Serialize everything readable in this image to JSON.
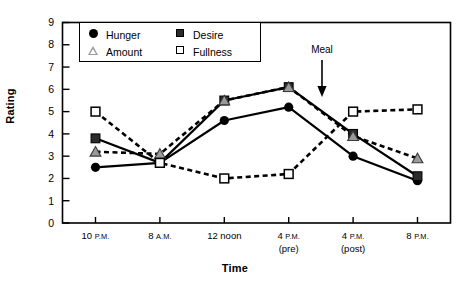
{
  "chart_data": {
    "type": "line",
    "title": "",
    "xlabel": "Time",
    "ylabel": "Rating",
    "ylim": [
      0,
      9
    ],
    "yticks": [
      0,
      1,
      2,
      3,
      4,
      5,
      6,
      7,
      8,
      9
    ],
    "grid": false,
    "legend_position": "top-left-inside",
    "categories": [
      "10 P.M.",
      "8 A.M.",
      "12 noon",
      "4 P.M. (pre)",
      "4 P.M. (post)",
      "8 P.M."
    ],
    "x_tick_labels": [
      {
        "main": "10",
        "ampm": "P.M.",
        "sub": ""
      },
      {
        "main": "8",
        "ampm": "A.M.",
        "sub": ""
      },
      {
        "main": "12 noon",
        "ampm": "",
        "sub": ""
      },
      {
        "main": "4",
        "ampm": "P.M.",
        "sub": "(pre)"
      },
      {
        "main": "4",
        "ampm": "P.M.",
        "sub": "(post)"
      },
      {
        "main": "8",
        "ampm": "P.M.",
        "sub": ""
      }
    ],
    "series": [
      {
        "name": "Hunger",
        "marker": "filled-circle",
        "line": "solid",
        "values": [
          2.5,
          2.7,
          4.6,
          5.2,
          3.0,
          1.9
        ]
      },
      {
        "name": "Desire",
        "marker": "filled-square",
        "line": "solid",
        "values": [
          3.8,
          2.7,
          5.5,
          6.1,
          4.0,
          2.1
        ]
      },
      {
        "name": "Amount",
        "marker": "open-triangle",
        "line": "dashed",
        "values": [
          3.2,
          3.1,
          5.5,
          6.1,
          3.9,
          2.9
        ]
      },
      {
        "name": "Fullness",
        "marker": "open-square",
        "line": "dashed",
        "values": [
          5.0,
          2.7,
          2.0,
          2.2,
          5.0,
          5.1
        ]
      }
    ],
    "annotations": [
      {
        "text": "Meal",
        "type": "arrow-down",
        "between": [
          "4 P.M. (pre)",
          "4 P.M. (post)"
        ]
      }
    ],
    "colors": {
      "line": "#000000",
      "marker_fill_dark": "#2b2b2b",
      "marker_fill_open": "#ffffff",
      "triangle_fill": "#9a9a9a",
      "frame": "#000000",
      "background": "#ffffff"
    }
  },
  "legend": {
    "items": [
      {
        "label": "Hunger",
        "icon": "filled-circle-icon"
      },
      {
        "label": "Desire",
        "icon": "filled-square-icon"
      },
      {
        "label": "Amount",
        "icon": "open-triangle-icon"
      },
      {
        "label": "Fullness",
        "icon": "open-square-icon"
      }
    ]
  },
  "axes": {
    "y_title": "Rating",
    "x_title": "Time",
    "y_ticks": [
      "9",
      "8",
      "7",
      "6",
      "5",
      "4",
      "3",
      "2",
      "1",
      "0"
    ]
  },
  "annotation": {
    "meal_label": "Meal"
  }
}
